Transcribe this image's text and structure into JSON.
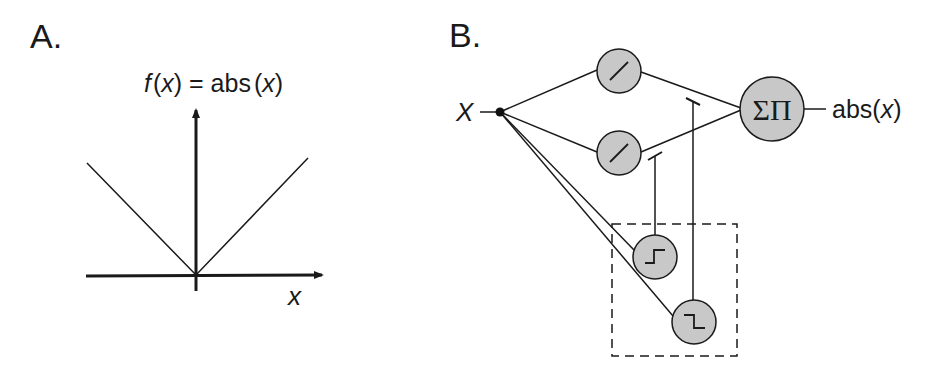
{
  "panel_a": {
    "label": "A.",
    "title_f": "f",
    "title_open": "(",
    "title_x": "x",
    "title_close": ")",
    "title_eq": " = abs",
    "title_open2": "(",
    "title_x2": "x",
    "title_close2": ")",
    "x_axis_label": "x"
  },
  "panel_b": {
    "label": "B.",
    "input_label": "X",
    "sum_product_symbol": "ΣΠ",
    "output_label_pre": "abs(",
    "output_label_x": "x",
    "output_label_post": ")",
    "nodes": [
      {
        "id": "linear-pos",
        "glyph": "ramp"
      },
      {
        "id": "linear-neg",
        "glyph": "ramp"
      },
      {
        "id": "step-up",
        "glyph": "step-up"
      },
      {
        "id": "step-down",
        "glyph": "step-down"
      },
      {
        "id": "sum-product",
        "glyph": "ΣΠ"
      }
    ]
  },
  "colors": {
    "node_fill": "#c8c8c8",
    "stroke": "#1a1a1a"
  }
}
